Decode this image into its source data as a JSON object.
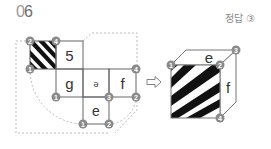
{
  "question": {
    "number_prefix": "0",
    "number_suffix": "6"
  },
  "answer": {
    "label": "정답 ③"
  },
  "net": {
    "faces": [
      {
        "id": "striped",
        "label": ""
      },
      {
        "id": "top",
        "label": "5"
      },
      {
        "id": "left",
        "label": "g"
      },
      {
        "id": "center",
        "label": "ə"
      },
      {
        "id": "right",
        "label": "f"
      },
      {
        "id": "bottom",
        "label": "e"
      }
    ],
    "markers": [
      "2",
      "4",
      "1",
      "1",
      "3",
      "4",
      "2",
      "1",
      "2"
    ]
  },
  "arrow": {
    "symbol": "⇨"
  },
  "cube": {
    "faces": [
      {
        "id": "top",
        "label": "e"
      },
      {
        "id": "right",
        "label": "f"
      },
      {
        "id": "front",
        "label": ""
      }
    ],
    "markers": [
      "1",
      "2",
      "3",
      "4"
    ]
  },
  "colors": {
    "marker": "#8a8a8a",
    "line": "#555555",
    "dash": "#999999"
  }
}
